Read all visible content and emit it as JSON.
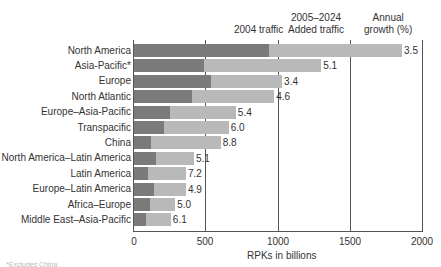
{
  "chart_data": {
    "type": "bar",
    "orientation": "horizontal",
    "stacked": true,
    "title": "",
    "xlabel": "RPKs in billions",
    "ylabel": "",
    "xlim": [
      0,
      2000
    ],
    "xticks": [
      "0",
      "500",
      "1000",
      "1500",
      "2000"
    ],
    "grid": "vertical lines at 500, 1000, 1500, 2000",
    "column_headers": [
      "2004 traffic",
      "2005–2024 Added traffic",
      "Annual growth (%)"
    ],
    "categories": [
      "North America",
      "Asia-Pacific*",
      "Europe",
      "North Atlantic",
      "Europe–Asia-Pacific",
      "Transpacific",
      "China",
      "North America–Latin America",
      "Latin America",
      "Europe–Latin America",
      "Africa–Europe",
      "Middle East–Asia-Pacific"
    ],
    "series": [
      {
        "name": "2004 traffic",
        "color": "#7a7a7a",
        "values": [
          935,
          485,
          530,
          400,
          250,
          210,
          120,
          150,
          95,
          140,
          110,
          85
        ]
      },
      {
        "name": "2005–2024 Added traffic",
        "color": "#b9b9b9",
        "values": [
          920,
          810,
          495,
          570,
          455,
          445,
          480,
          265,
          265,
          220,
          175,
          170
        ]
      }
    ],
    "totals": [
      1855,
      1295,
      1025,
      970,
      705,
      655,
      600,
      415,
      360,
      360,
      285,
      255
    ],
    "annual_growth_pct": [
      "3.5",
      "5.1",
      "3.4",
      "4.6",
      "5.4",
      "6.0",
      "8.8",
      "5.1",
      "7.2",
      "4.9",
      "5.0",
      "6.1"
    ],
    "legend_position": "top column headers"
  },
  "headers": {
    "h2004": "2004 traffic",
    "h_added_1": "2005–2024",
    "h_added_2": "Added traffic",
    "h_growth_1": "Annual",
    "h_growth_2": "growth (%)"
  },
  "axis": {
    "ticks": [
      "0",
      "500",
      "1000",
      "1500",
      "2000"
    ],
    "label": "RPKs in billions"
  },
  "footnote": "*Excludes China"
}
